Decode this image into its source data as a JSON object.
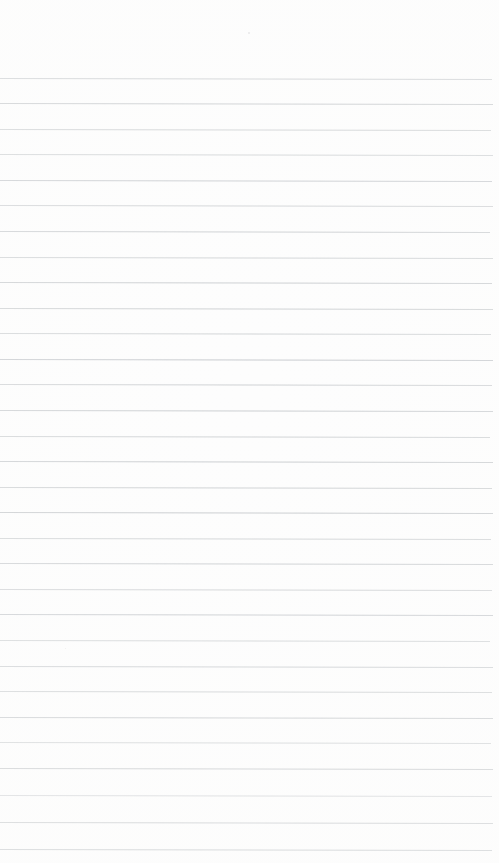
{
  "document": {
    "kind": "lined-paper-scan",
    "title": "Blank Ruled Notepad Page",
    "text_content": "",
    "is_blank": true,
    "page_width": 499,
    "page_height": 863
  },
  "paper": {
    "background_color": "#fdfdfd",
    "edge_color": "#f9f9f8"
  },
  "ruling": {
    "line_color": "#b9bdc1",
    "line_thickness": 1,
    "line_spacing": 25.4,
    "first_line_y": 78,
    "last_line_y": 849,
    "line_start_x": 0,
    "line_end_x": 493,
    "skew_degrees": 0.12,
    "line_count": 31,
    "lines": [
      {
        "y": 78,
        "opacity": 0.72,
        "end_x": 492
      },
      {
        "y": 103,
        "opacity": 0.8,
        "end_x": 493
      },
      {
        "y": 129,
        "opacity": 0.7,
        "end_x": 491
      },
      {
        "y": 154,
        "opacity": 0.66,
        "end_x": 493
      },
      {
        "y": 180,
        "opacity": 0.78,
        "end_x": 492
      },
      {
        "y": 205,
        "opacity": 0.68,
        "end_x": 493
      },
      {
        "y": 231,
        "opacity": 0.74,
        "end_x": 490
      },
      {
        "y": 257,
        "opacity": 0.66,
        "end_x": 493
      },
      {
        "y": 282,
        "opacity": 0.76,
        "end_x": 492
      },
      {
        "y": 308,
        "opacity": 0.7,
        "end_x": 493
      },
      {
        "y": 333,
        "opacity": 0.64,
        "end_x": 491
      },
      {
        "y": 359,
        "opacity": 0.78,
        "end_x": 493
      },
      {
        "y": 384,
        "opacity": 0.68,
        "end_x": 492
      },
      {
        "y": 410,
        "opacity": 0.72,
        "end_x": 493
      },
      {
        "y": 436,
        "opacity": 0.66,
        "end_x": 490
      },
      {
        "y": 461,
        "opacity": 0.76,
        "end_x": 493
      },
      {
        "y": 487,
        "opacity": 0.7,
        "end_x": 492
      },
      {
        "y": 512,
        "opacity": 0.8,
        "end_x": 493
      },
      {
        "y": 538,
        "opacity": 0.66,
        "end_x": 491
      },
      {
        "y": 563,
        "opacity": 0.74,
        "end_x": 493
      },
      {
        "y": 589,
        "opacity": 0.68,
        "end_x": 492
      },
      {
        "y": 614,
        "opacity": 0.78,
        "end_x": 493
      },
      {
        "y": 640,
        "opacity": 0.64,
        "end_x": 490
      },
      {
        "y": 666,
        "opacity": 0.72,
        "end_x": 493
      },
      {
        "y": 691,
        "opacity": 0.7,
        "end_x": 492
      },
      {
        "y": 717,
        "opacity": 0.8,
        "end_x": 493
      },
      {
        "y": 742,
        "opacity": 0.66,
        "end_x": 491
      },
      {
        "y": 768,
        "opacity": 0.82,
        "end_x": 493
      },
      {
        "y": 795,
        "opacity": 0.62,
        "end_x": 492
      },
      {
        "y": 822,
        "opacity": 0.8,
        "end_x": 493
      },
      {
        "y": 849,
        "opacity": 0.84,
        "end_x": 492
      }
    ]
  },
  "artifacts": {
    "specks": [
      {
        "x": 248,
        "y": 32,
        "size": 2,
        "color": "#e9e9ea"
      },
      {
        "x": 65,
        "y": 648,
        "size": 1,
        "color": "#eeeeee"
      }
    ]
  }
}
